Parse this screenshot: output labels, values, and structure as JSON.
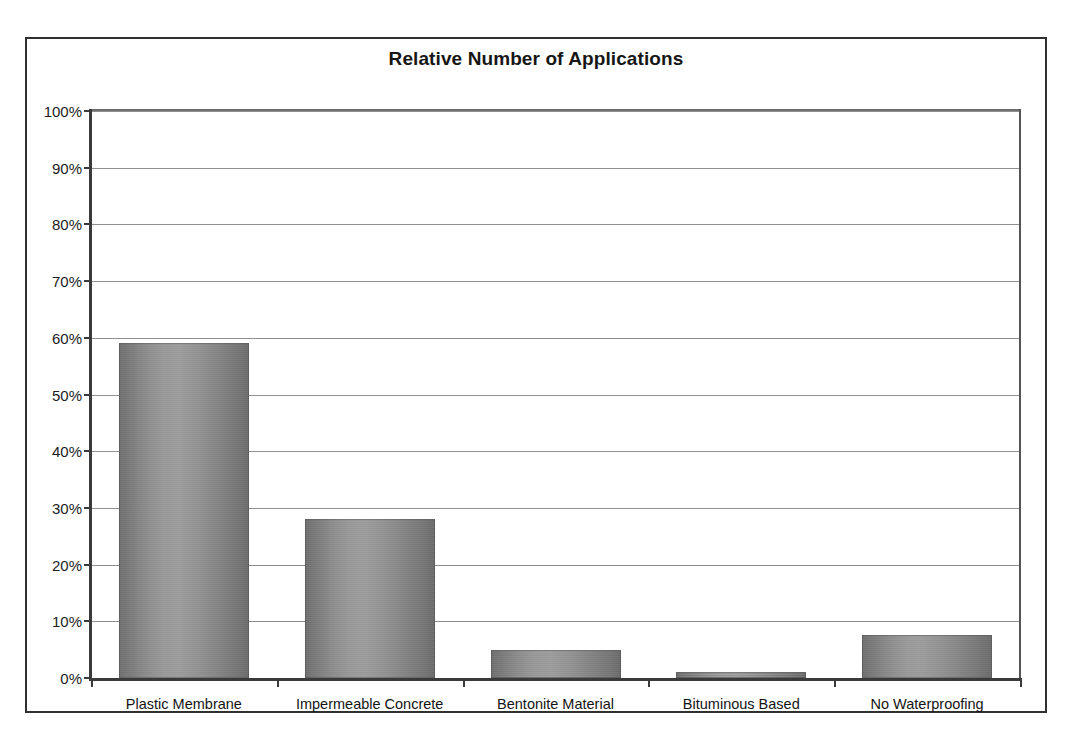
{
  "chart_data": {
    "type": "bar",
    "title": "Relative Number of Applications",
    "xlabel": "",
    "ylabel": "",
    "categories": [
      "Plastic Membrane",
      "Impermeable Concrete",
      "Bentonite Material",
      "Bituminous Based",
      "No Waterproofing"
    ],
    "values": [
      59,
      28,
      5,
      1,
      7.5
    ],
    "ylim": [
      0,
      100
    ],
    "ytick_labels": [
      "100%",
      "90%",
      "80%",
      "70%",
      "60%",
      "50%",
      "40%",
      "30%",
      "20%",
      "10%",
      "0%"
    ],
    "ytick_values": [
      100,
      90,
      80,
      70,
      60,
      50,
      40,
      30,
      20,
      10,
      0
    ],
    "grid": true,
    "legend": false,
    "value_unit": "%",
    "bar_color": "#8c8c8c",
    "gridline_color": "#8f8f8f",
    "axis_color": "#3a3a3a",
    "title_color": "#161616",
    "background_color": "#ffffff"
  }
}
